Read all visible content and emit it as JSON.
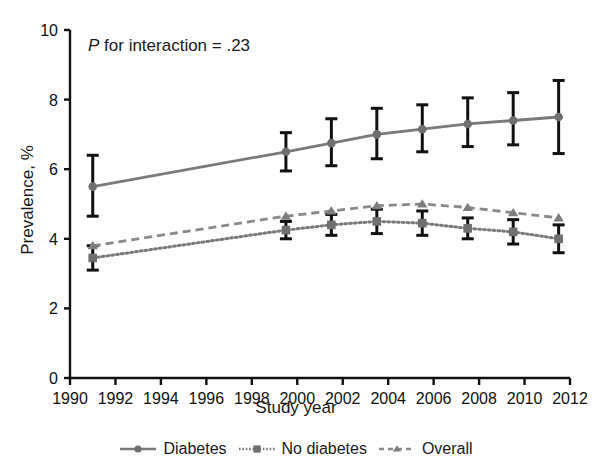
{
  "chart_data": {
    "type": "line",
    "title": "",
    "subtitle": "",
    "xlabel": "Study year",
    "ylabel": "Prevalence, %",
    "annotation": "P for interaction = .23",
    "annotation_italic_prefix": "P",
    "annotation_rest": " for interaction = .23",
    "xlim": [
      1990,
      2012
    ],
    "ylim": [
      0,
      10
    ],
    "xticks": [
      1990,
      1992,
      1994,
      1996,
      1998,
      2000,
      2002,
      2004,
      2006,
      2008,
      2010,
      2012
    ],
    "yticks": [
      0,
      2,
      4,
      6,
      8,
      10
    ],
    "grid": false,
    "legend_position": "bottom",
    "error_bars": "95% CI",
    "series": [
      {
        "name": "Diabetes",
        "marker": "circle",
        "linestyle": "solid",
        "color": "#7a7a7a",
        "x": [
          1991,
          1999.5,
          2001.5,
          2003.5,
          2005.5,
          2007.5,
          2009.5,
          2011.5
        ],
        "values": [
          5.5,
          6.5,
          6.75,
          7.0,
          7.15,
          7.3,
          7.4,
          7.5
        ],
        "ci_low": [
          4.65,
          5.95,
          6.1,
          6.3,
          6.5,
          6.65,
          6.7,
          6.45
        ],
        "ci_high": [
          6.4,
          7.05,
          7.45,
          7.75,
          7.85,
          8.05,
          8.2,
          8.55
        ]
      },
      {
        "name": "No diabetes",
        "marker": "square",
        "linestyle": "dotted",
        "color": "#7a7a7a",
        "x": [
          1991,
          1999.5,
          2001.5,
          2003.5,
          2005.5,
          2007.5,
          2009.5,
          2011.5
        ],
        "values": [
          3.45,
          4.25,
          4.4,
          4.5,
          4.45,
          4.3,
          4.2,
          4.0
        ],
        "ci_low": [
          3.1,
          4.0,
          4.1,
          4.15,
          4.1,
          4.0,
          3.85,
          3.6
        ],
        "ci_high": [
          3.8,
          4.5,
          4.7,
          4.85,
          4.8,
          4.6,
          4.55,
          4.4
        ]
      },
      {
        "name": "Overall",
        "marker": "triangle",
        "linestyle": "dashed",
        "color": "#8a8a8a",
        "x": [
          1991,
          1999.5,
          2001.5,
          2003.5,
          2005.5,
          2007.5,
          2009.5,
          2011.5
        ],
        "values": [
          3.8,
          4.65,
          4.8,
          4.95,
          5.0,
          4.9,
          4.75,
          4.6
        ],
        "ci_low": [
          3.8,
          4.65,
          4.8,
          4.95,
          5.0,
          4.9,
          4.75,
          4.6
        ],
        "ci_high": [
          3.8,
          4.65,
          4.8,
          4.95,
          5.0,
          4.9,
          4.75,
          4.6
        ]
      }
    ]
  },
  "legend": {
    "items": [
      {
        "label": "Diabetes"
      },
      {
        "label": "No diabetes"
      },
      {
        "label": "Overall"
      }
    ]
  },
  "axis_labels": {
    "x": "Study year",
    "y": "Prevalence, %"
  }
}
